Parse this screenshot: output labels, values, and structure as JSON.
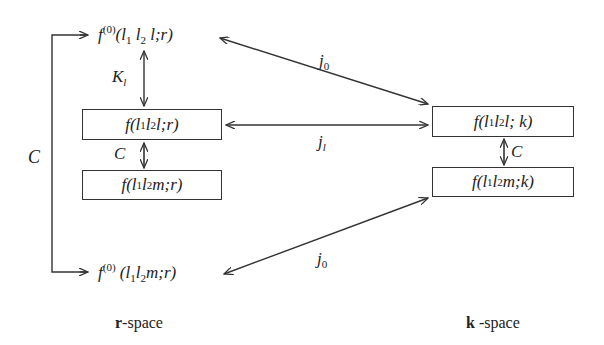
{
  "diagram": {
    "nodes": {
      "f0_l": {
        "f": "f",
        "sup": "(0)",
        "l1": "l",
        "s1": "1",
        "l2": "l",
        "s2": "2",
        "tail": " l;r)"
      },
      "f_l_r": {
        "text": "f(l",
        "s1": "1",
        "mid": "l",
        "s2": "2",
        "tail": "l;r)"
      },
      "f_m_r": {
        "text": "f(l",
        "s1": "1",
        "mid": "l",
        "s2": "2",
        "tail": "m;r)"
      },
      "f_l_k": {
        "text": "f(l",
        "s1": "1",
        "mid": "l",
        "s2": "2",
        "tail": "l; k)"
      },
      "f_m_k": {
        "text": "f(l",
        "s1": "1",
        "mid": "l",
        "s2": "2",
        "tail": "m;k)"
      },
      "f0_m": {
        "f": "f",
        "sup": "(0)",
        "l1": "l",
        "s1": "1",
        "l2": "l",
        "s2": "2",
        "tail": "m;r)"
      }
    },
    "edge_labels": {
      "K_l": {
        "main": "K",
        "sub": "l"
      },
      "C_left_bracket": "C",
      "C_r": "C",
      "C_k": "C",
      "j0_top": {
        "main": "j",
        "sub": "0"
      },
      "j1": {
        "main": "j",
        "sub": "l"
      },
      "j0_bottom": {
        "main": "j",
        "sub": "0"
      }
    },
    "space_labels": {
      "r": {
        "bold": "r",
        "rest": "-space"
      },
      "k": {
        "bold": "k",
        "rest": " -space"
      }
    },
    "colors": {
      "line": "#333333",
      "background": "#ffffff"
    }
  }
}
